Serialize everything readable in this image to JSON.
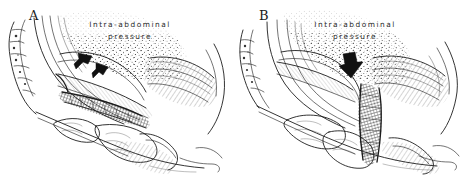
{
  "figure": {
    "kind": "medical-line-illustration",
    "technique": "pen-and-ink stipple and hatch",
    "background_color": "#ffffff",
    "ink_color": "#1d1d1d",
    "panel_count": 2
  },
  "panels": [
    {
      "letter": "A",
      "caption_line1": "Intra-abdominal",
      "caption_line2": "pressure",
      "arrow_count": 2,
      "arrow_direction": "down-left",
      "arrow_color": "#111111",
      "description": "Mid-sagittal pelvic section with horizontally supported urethra beneath the pressure field"
    },
    {
      "letter": "B",
      "caption_line1": "Intra-abdominal",
      "caption_line2": "pressure",
      "arrow_count": 1,
      "arrow_direction": "down",
      "arrow_color": "#111111",
      "description": "Mid-sagittal pelvic section with descended vertically oriented urethra under the pressure field"
    }
  ]
}
